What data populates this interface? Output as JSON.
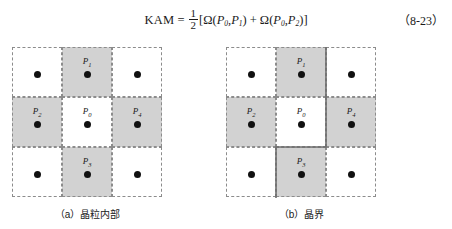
{
  "equation": {
    "lhs": "KAM",
    "equals": "=",
    "fraction": {
      "numerator": "1",
      "denominator": "2"
    },
    "bracket_open": "[",
    "term1": {
      "symbol": "Ω",
      "open": "(",
      "arg1": "P",
      "arg1_sub": "0",
      "comma": ",",
      "arg2": "P",
      "arg2_sub": "1",
      "close": ")"
    },
    "plus": "+",
    "term2": {
      "symbol": "Ω",
      "open": "(",
      "arg1": "P",
      "arg1_sub": "0",
      "comma": ",",
      "arg2": "P",
      "arg2_sub": "2",
      "close": ")"
    },
    "bracket_close": "]",
    "number": "（8-23）"
  },
  "figures": [
    {
      "id": "a",
      "caption": "（a）晶粒内部",
      "cells": [
        {
          "row": 0,
          "col": 0,
          "shaded": false,
          "label": "",
          "label_sub": ""
        },
        {
          "row": 0,
          "col": 1,
          "shaded": true,
          "label": "P",
          "label_sub": "1"
        },
        {
          "row": 0,
          "col": 2,
          "shaded": false,
          "label": "",
          "label_sub": ""
        },
        {
          "row": 1,
          "col": 0,
          "shaded": true,
          "label": "P",
          "label_sub": "2"
        },
        {
          "row": 1,
          "col": 1,
          "shaded": false,
          "label": "P",
          "label_sub": "0"
        },
        {
          "row": 1,
          "col": 2,
          "shaded": true,
          "label": "P",
          "label_sub": "4"
        },
        {
          "row": 2,
          "col": 0,
          "shaded": false,
          "label": "",
          "label_sub": ""
        },
        {
          "row": 2,
          "col": 1,
          "shaded": true,
          "label": "P",
          "label_sub": "3"
        },
        {
          "row": 2,
          "col": 2,
          "shaded": false,
          "label": "",
          "label_sub": ""
        }
      ],
      "has_boundary": false
    },
    {
      "id": "b",
      "caption": "（b）晶界",
      "cells": [
        {
          "row": 0,
          "col": 0,
          "shaded": false,
          "label": "",
          "label_sub": ""
        },
        {
          "row": 0,
          "col": 1,
          "shaded": true,
          "label": "P",
          "label_sub": "1"
        },
        {
          "row": 0,
          "col": 2,
          "shaded": false,
          "label": "",
          "label_sub": ""
        },
        {
          "row": 1,
          "col": 0,
          "shaded": true,
          "label": "P",
          "label_sub": "2"
        },
        {
          "row": 1,
          "col": 1,
          "shaded": false,
          "label": "P",
          "label_sub": "0"
        },
        {
          "row": 1,
          "col": 2,
          "shaded": true,
          "label": "P",
          "label_sub": "4"
        },
        {
          "row": 2,
          "col": 0,
          "shaded": false,
          "label": "",
          "label_sub": ""
        },
        {
          "row": 2,
          "col": 1,
          "shaded": true,
          "label": "P",
          "label_sub": "3"
        },
        {
          "row": 2,
          "col": 2,
          "shaded": false,
          "label": "",
          "label_sub": ""
        }
      ],
      "has_boundary": true
    }
  ],
  "colors": {
    "shaded_cell": "#d2d2d2",
    "cell_border": "#8c8c8c",
    "dot": "#111111",
    "boundary_line": "#6e6e6e",
    "page_background": "#ffffff"
  }
}
